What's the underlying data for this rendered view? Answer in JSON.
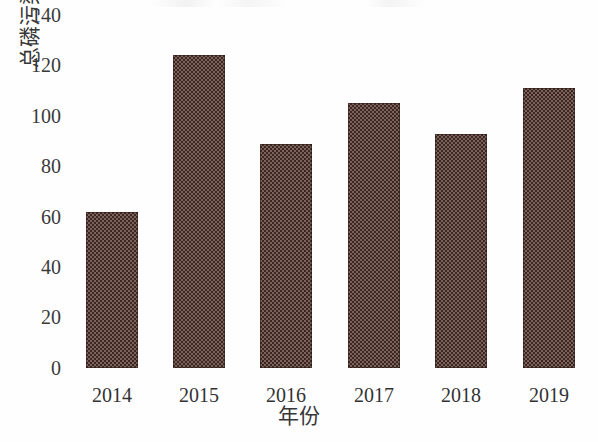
{
  "chart_data": {
    "type": "bar",
    "title": "",
    "xlabel": "年份",
    "ylabel": "总磷污染物通量（t）",
    "categories": [
      "2014",
      "2015",
      "2016",
      "2017",
      "2018",
      "2019"
    ],
    "values": [
      62,
      124,
      89,
      105,
      93,
      111
    ],
    "ylim": [
      0,
      140
    ],
    "ytick_step": 20,
    "yticks": [
      "140",
      "120",
      "100",
      "80",
      "60",
      "40",
      "20",
      "0"
    ],
    "ytick_values": [
      140,
      120,
      100,
      80,
      60,
      40,
      20,
      0
    ],
    "grid": false,
    "legend": false,
    "legend_position": "none",
    "series": [
      {
        "name": "总磷污染物通量",
        "values": [
          62,
          124,
          89,
          105,
          93,
          111
        ]
      }
    ],
    "bar_color": "#463029",
    "bar_pattern": "checkered",
    "background_color": "#ffffff",
    "axis_color": "#333333"
  }
}
